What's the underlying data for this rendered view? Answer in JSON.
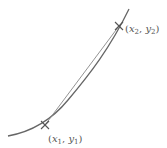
{
  "diagram": {
    "type": "secant-chord-on-convex-curve",
    "curve_color": "#666666",
    "chord_color": "#888888",
    "marker_color": "#555555",
    "points": [
      {
        "id": "p1",
        "var_x": "x",
        "sub_x": "1",
        "var_y": "y",
        "sub_y": "1",
        "label": "(x1, y1)"
      },
      {
        "id": "p2",
        "var_x": "x",
        "sub_x": "2",
        "var_y": "y",
        "sub_y": "2",
        "label": "(x2, y2)"
      }
    ],
    "label_parts": {
      "open": "(",
      "comma": ", ",
      "close": ")"
    }
  }
}
